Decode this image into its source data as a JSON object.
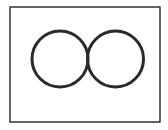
{
  "diagram": {
    "frame": {
      "x": 10,
      "y": 7,
      "width": 150,
      "height": 115,
      "stroke": "#333333",
      "stroke_width": 1.5
    },
    "circles": [
      {
        "name": "left-circle",
        "cx": 60,
        "cy": 59,
        "r": 28,
        "stroke": "#2a2a2a",
        "stroke_width": 3
      },
      {
        "name": "right-circle",
        "cx": 115.5,
        "cy": 59,
        "r": 28,
        "stroke": "#2a2a2a",
        "stroke_width": 3
      }
    ],
    "background": "#ffffff"
  }
}
